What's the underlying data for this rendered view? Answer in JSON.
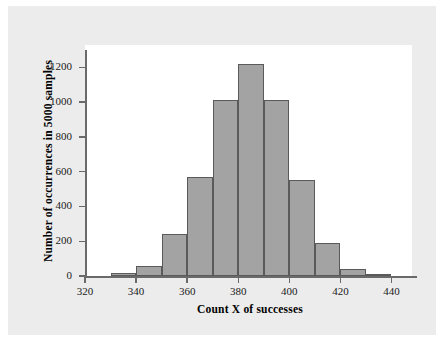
{
  "figure": {
    "background_color": "#ececec",
    "plot_background_color": "#ffffff",
    "axis_color": "#6a6a6a",
    "bar_fill_color": "#a3a3a3",
    "bar_edge_color": "#5a5a5a"
  },
  "chart_data": {
    "type": "bar",
    "title": "",
    "subtitle": "",
    "xlabel": "Count X of successes",
    "ylabel": "Number of occurrences in 5000 samples",
    "xlim": [
      320,
      450
    ],
    "ylim": [
      0,
      1300
    ],
    "xticks": [
      320,
      340,
      360,
      380,
      400,
      420,
      440
    ],
    "xtick_labels": [
      "320",
      "340",
      "360",
      "380",
      "400",
      "420",
      "440"
    ],
    "yticks": [
      0,
      200,
      400,
      600,
      800,
      1000,
      1200
    ],
    "ytick_labels": [
      "0",
      "200",
      "400",
      "600",
      "800",
      "1000",
      "1200"
    ],
    "grid": false,
    "legend": null,
    "bin_width": 10,
    "bin_edges": [
      330,
      340,
      350,
      360,
      370,
      380,
      390,
      400,
      410,
      420,
      430,
      440
    ],
    "categories": [
      "330-340",
      "340-350",
      "350-360",
      "360-370",
      "370-380",
      "380-390",
      "390-400",
      "400-410",
      "410-420",
      "420-430",
      "430-440"
    ],
    "bin_centers": [
      335,
      345,
      355,
      365,
      375,
      385,
      395,
      405,
      415,
      425,
      435
    ],
    "values": [
      20,
      60,
      240,
      570,
      1015,
      1220,
      1010,
      550,
      190,
      40,
      10
    ],
    "annotations": []
  }
}
